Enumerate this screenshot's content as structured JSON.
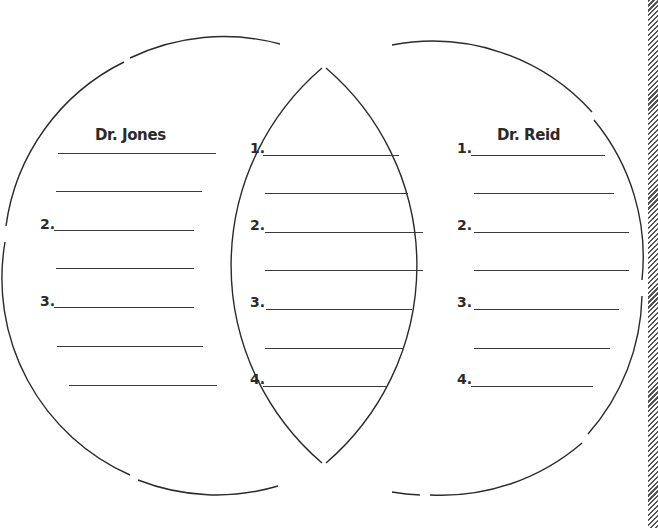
{
  "diagram": {
    "type": "venn",
    "left": {
      "title": "Dr. Jones",
      "rows": [
        {
          "label": ""
        },
        {
          "label": ""
        },
        {
          "label": "2."
        },
        {
          "label": ""
        },
        {
          "label": "3."
        },
        {
          "label": ""
        },
        {
          "label": ""
        }
      ]
    },
    "center": {
      "rows": [
        {
          "label": "1."
        },
        {
          "label": ""
        },
        {
          "label": "2."
        },
        {
          "label": ""
        },
        {
          "label": "3."
        },
        {
          "label": ""
        },
        {
          "label": "4."
        }
      ]
    },
    "right": {
      "title": "Dr. Reid",
      "rows": [
        {
          "label": "1."
        },
        {
          "label": ""
        },
        {
          "label": "2."
        },
        {
          "label": ""
        },
        {
          "label": "3."
        },
        {
          "label": ""
        },
        {
          "label": "4."
        }
      ]
    }
  },
  "colors": {
    "stroke": "#2a2a2a",
    "background": "#ffffff"
  }
}
